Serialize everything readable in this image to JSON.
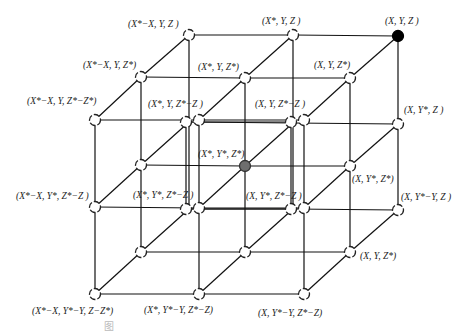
{
  "diagram": {
    "type": "3x3x3 lattice cube (isometric)",
    "colors": {
      "line": "#111111",
      "node_fill": "#ffffff",
      "node_stroke": "#222222",
      "target_node": "#000000",
      "center_node": "#6e6e6e"
    },
    "nodes": [
      {
        "id": "b00",
        "x": 189,
        "y": 35,
        "style": "dashed"
      },
      {
        "id": "b10",
        "x": 293,
        "y": 35,
        "style": "dashed"
      },
      {
        "id": "b20",
        "x": 398,
        "y": 36,
        "style": "filled-black"
      },
      {
        "id": "b21",
        "x": 398,
        "y": 124,
        "style": "dashed"
      },
      {
        "id": "b22",
        "x": 398,
        "y": 210,
        "style": "dashed"
      },
      {
        "id": "m00",
        "x": 141,
        "y": 77,
        "style": "dashed"
      },
      {
        "id": "m10",
        "x": 245,
        "y": 78,
        "style": "dashed"
      },
      {
        "id": "m20",
        "x": 350,
        "y": 78,
        "style": "dashed"
      },
      {
        "id": "m01",
        "x": 141,
        "y": 165,
        "style": "dashed"
      },
      {
        "id": "m11",
        "x": 245,
        "y": 166,
        "style": "filled-gray"
      },
      {
        "id": "m21",
        "x": 350,
        "y": 166,
        "style": "dashed"
      },
      {
        "id": "m02",
        "x": 141,
        "y": 252,
        "style": "dashed"
      },
      {
        "id": "m12",
        "x": 245,
        "y": 252,
        "style": "dashed"
      },
      {
        "id": "m22",
        "x": 350,
        "y": 252,
        "style": "dashed"
      },
      {
        "id": "f00",
        "x": 95,
        "y": 120,
        "style": "dashed"
      },
      {
        "id": "f10",
        "x": 199,
        "y": 120,
        "style": "dashed"
      },
      {
        "id": "f10b",
        "x": 186,
        "y": 122,
        "style": "dashed"
      },
      {
        "id": "f20",
        "x": 304,
        "y": 120,
        "style": "dashed"
      },
      {
        "id": "f20b",
        "x": 291,
        "y": 122,
        "style": "dashed"
      },
      {
        "id": "f01",
        "x": 95,
        "y": 207,
        "style": "dashed"
      },
      {
        "id": "f11",
        "x": 199,
        "y": 208,
        "style": "dashed"
      },
      {
        "id": "f11b",
        "x": 186,
        "y": 209,
        "style": "dashed"
      },
      {
        "id": "f21",
        "x": 304,
        "y": 208,
        "style": "dashed"
      },
      {
        "id": "f21b",
        "x": 291,
        "y": 209,
        "style": "dashed"
      },
      {
        "id": "f02",
        "x": 95,
        "y": 294,
        "style": "dashed"
      },
      {
        "id": "f12",
        "x": 199,
        "y": 294,
        "style": "dashed"
      },
      {
        "id": "f22",
        "x": 304,
        "y": 294,
        "style": "dashed"
      }
    ],
    "labels": [
      {
        "text": "(X*−X, Y, Z )",
        "x": 128,
        "y": 27
      },
      {
        "text": "(X*, Y, Z )",
        "x": 262,
        "y": 24
      },
      {
        "text": "(X, Y, Z )",
        "x": 385,
        "y": 24
      },
      {
        "text": "(X*−X, Y, Z*)",
        "x": 83,
        "y": 68
      },
      {
        "text": "(X*, Y, Z*)",
        "x": 198,
        "y": 70
      },
      {
        "text": "(X, Y, Z*)",
        "x": 314,
        "y": 68
      },
      {
        "text": "(X*−X, Y, Z*−Z*)",
        "x": 27,
        "y": 104
      },
      {
        "text": "(X*, Y, Z*−Z )",
        "x": 148,
        "y": 107
      },
      {
        "text": "(X, Y, Z*−Z )",
        "x": 255,
        "y": 107
      },
      {
        "text": "(X, Y*, Z )",
        "x": 404,
        "y": 113
      },
      {
        "text": "(X*, Y*, Z*)",
        "x": 198,
        "y": 157
      },
      {
        "text": "(X, Y*, Z*)",
        "x": 352,
        "y": 182
      },
      {
        "text": "(X*−X, Y*, Z*−Z )",
        "x": 16,
        "y": 199
      },
      {
        "text": "(X*, Y*, Z*−Z )",
        "x": 133,
        "y": 198
      },
      {
        "text": "(X, Y*, Z*−Z )",
        "x": 246,
        "y": 199
      },
      {
        "text": "(X, Y*−Y, Z )",
        "x": 401,
        "y": 200
      },
      {
        "text": "(X, Y, Z*)",
        "x": 360,
        "y": 259
      },
      {
        "text": "(X*−X, Y*−Y, Z−Z*)",
        "x": 32,
        "y": 314
      },
      {
        "text": "(X*, Y*−Y, Z*−Z)",
        "x": 144,
        "y": 313
      },
      {
        "text": "(X, Y*−Y, Z*−Z)",
        "x": 258,
        "y": 316
      }
    ],
    "caption": "图"
  }
}
